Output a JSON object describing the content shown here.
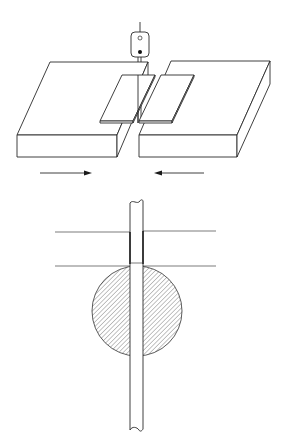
{
  "diagram": {
    "type": "technical-illustration",
    "panels": [
      {
        "id": "top",
        "description": "Two blocks pushed toward each other with thin plates over a gap and a probe above"
      },
      {
        "id": "bottom",
        "description": "Cross-section: shaft through a hatched circle between two horizontal lines"
      }
    ],
    "colors": {
      "stroke": "#2a2a2a",
      "background": "#ffffff",
      "hatch": "#555555"
    },
    "arrows": [
      {
        "direction": "right"
      },
      {
        "direction": "left"
      }
    ]
  }
}
